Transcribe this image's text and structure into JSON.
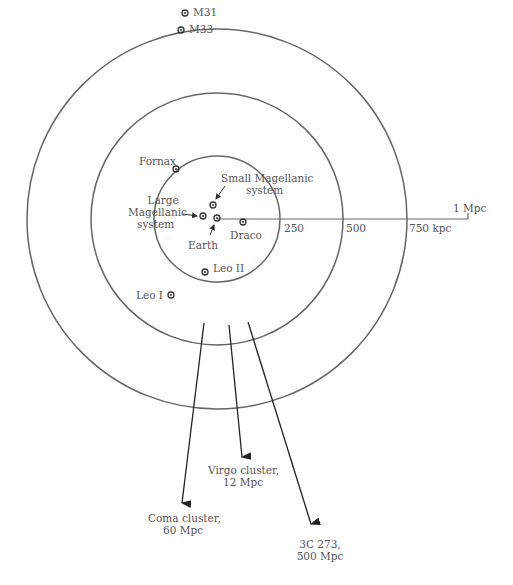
{
  "labels": {
    "m31": "M31",
    "m33": "M33",
    "fornax": "Fornax",
    "small1": "Small Magellanic",
    "small2": "system",
    "large1": "Large",
    "large2": "Magellanic",
    "large3": "system",
    "earth": "Earth",
    "draco": "Draco",
    "leo2": "Leo II",
    "leo1": "Leo I",
    "s250": "250",
    "s500": "500",
    "s750": "750 kpc",
    "s1": "1 Mpc",
    "virgo1": "Virgo cluster,",
    "virgo2": "12 Mpc",
    "coma1": "Coma cluster,",
    "coma2": "60 Mpc",
    "q1": "3C 273,",
    "q2": "500 Mpc"
  },
  "colors": {
    "line": "#555555",
    "arrow": "#222222"
  }
}
